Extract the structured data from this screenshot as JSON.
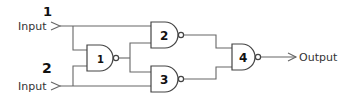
{
  "diagram": {
    "type": "logic-circuit",
    "inputs": [
      {
        "label": "Input",
        "number_mark": "1"
      },
      {
        "label": "Input",
        "number_mark": "2"
      }
    ],
    "output": {
      "label": "Output"
    },
    "gates": [
      {
        "id": "1",
        "kind": "NAND",
        "mark": "1"
      },
      {
        "id": "2",
        "kind": "NAND",
        "mark": "2"
      },
      {
        "id": "3",
        "kind": "NAND",
        "mark": "3"
      },
      {
        "id": "4",
        "kind": "NAND",
        "mark": "4"
      }
    ],
    "colors": {
      "wire": "#666666",
      "gate_outline": "#444444",
      "text": "#333333"
    }
  }
}
